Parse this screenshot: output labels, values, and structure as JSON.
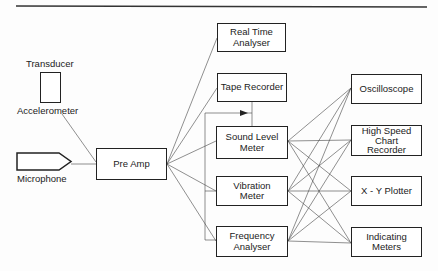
{
  "diagram": {
    "title_rule": true,
    "inputs": {
      "transducer_label": "Transducer",
      "accelerometer_label": "Accelerometer",
      "microphone_label": "Microphone"
    },
    "preamp": {
      "label": "Pre Amp"
    },
    "analysers": [
      {
        "id": "real-time-analyser",
        "label": "Real Time\nAnalyser"
      },
      {
        "id": "tape-recorder",
        "label": "Tape Recorder"
      },
      {
        "id": "sound-level-meter",
        "label": "Sound Level\nMeter"
      },
      {
        "id": "vibration-meter",
        "label": "Vibration\nMeter"
      },
      {
        "id": "frequency-analyser",
        "label": "Frequency\nAnalyser"
      }
    ],
    "outputs": [
      {
        "id": "oscilloscope",
        "label": "Oscilloscope"
      },
      {
        "id": "high-speed-chart-recorder",
        "label": "High Speed\nChart\nRecorder"
      },
      {
        "id": "xy-plotter",
        "label": "X - Y Plotter"
      },
      {
        "id": "indicating-meters",
        "label": "Indicating\nMeters"
      }
    ],
    "stroke_color": "#222222"
  }
}
